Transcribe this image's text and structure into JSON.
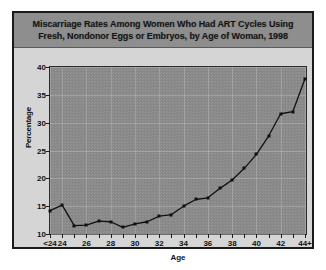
{
  "title": {
    "line1": "Miscarriage Rates Among Women Who Had ART Cycles Using",
    "line2": "Fresh, Nondonor Eggs or Embryos, by Age of Woman, 1998"
  },
  "axes": {
    "ylabel": "Percentage",
    "xlabel": "Age"
  },
  "colors": {
    "frame": "#1a1a1a",
    "title_band": "#8e8e8e",
    "figure_background": "#d8d8d8",
    "plot_background": "#8a8a8a",
    "series": "#101010",
    "text": "#111111"
  },
  "chart_data": {
    "type": "line",
    "title": "Miscarriage Rates Among Women Who Had ART Cycles Using Fresh, Nondonor Eggs or Embryos, by Age of Woman, 1998",
    "xlabel": "Age",
    "ylabel": "Percentage",
    "grid": true,
    "legend": "none",
    "ylim": [
      10,
      40
    ],
    "ytick_values": [
      10,
      15,
      20,
      25,
      30,
      35,
      40
    ],
    "ytick_labels": [
      "10",
      "15",
      "20",
      "25",
      "30",
      "35",
      "40"
    ],
    "categories": [
      "<24",
      "24",
      "25",
      "26",
      "27",
      "28",
      "29",
      "30",
      "31",
      "32",
      "33",
      "34",
      "35",
      "36",
      "37",
      "38",
      "39",
      "40",
      "41",
      "42",
      "43",
      "44+"
    ],
    "xtick_labels": [
      "<24",
      "24",
      "",
      "26",
      "",
      "28",
      "",
      "30",
      "",
      "32",
      "",
      "34",
      "",
      "36",
      "",
      "38",
      "",
      "40",
      "",
      "42",
      "",
      "44+"
    ],
    "values": [
      14.2,
      15.2,
      11.5,
      11.6,
      12.3,
      12.2,
      11.2,
      11.8,
      12.2,
      13.2,
      13.5,
      15.0,
      16.2,
      16.5,
      18.2,
      19.7,
      21.8,
      24.3,
      27.6,
      31.6,
      32.0,
      37.9
    ]
  }
}
